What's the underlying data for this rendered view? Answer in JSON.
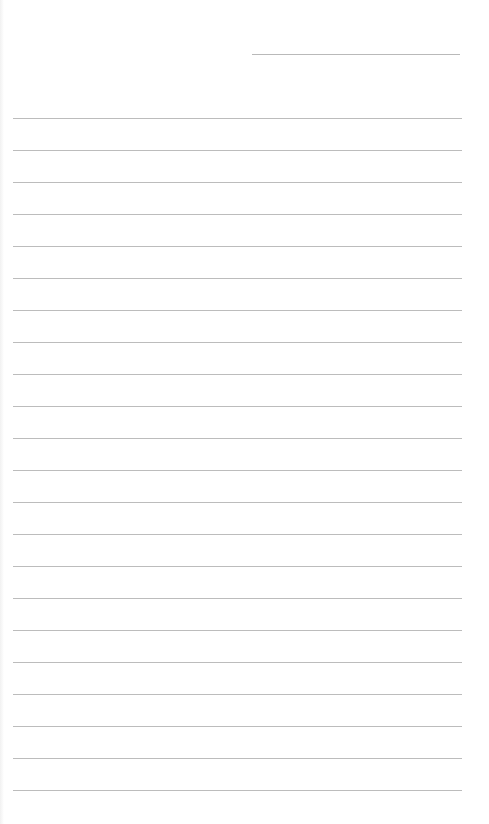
{
  "page": {
    "type": "lined-notebook-page",
    "background_color": "#ffffff",
    "line_color": "#bcbcbc",
    "header_line": {
      "label": "",
      "left": 252,
      "top": 54,
      "width": 208
    },
    "ruled_lines": {
      "count": 22,
      "first_top": 118,
      "spacing": 32,
      "left": 13,
      "width": 449,
      "lines": [
        "",
        "",
        "",
        "",
        "",
        "",
        "",
        "",
        "",
        "",
        "",
        "",
        "",
        "",
        "",
        "",
        "",
        "",
        "",
        "",
        "",
        ""
      ]
    }
  }
}
